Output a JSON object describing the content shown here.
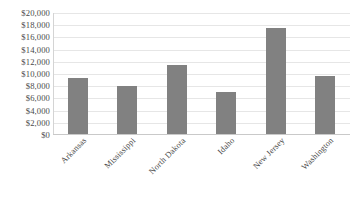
{
  "chart_data": {
    "type": "bar",
    "title": "",
    "subtitle": "",
    "xlabel": "",
    "ylabel": "",
    "categories": [
      "Arkansas",
      "Mississippi",
      "North Dakota",
      "Idaho",
      "New Jersey",
      "Washington"
    ],
    "values": [
      9350,
      8050,
      11500,
      7000,
      17600,
      9600
    ],
    "ylim": [
      0,
      20000
    ],
    "ytick_step": 2000,
    "ytick_labels": [
      "$0",
      "$2,000",
      "$4,000",
      "$6,000",
      "$8,000",
      "$10,000",
      "$12,000",
      "$14,000",
      "$16,000",
      "$18,000",
      "$20,000"
    ],
    "ytick_values": [
      0,
      2000,
      4000,
      6000,
      8000,
      10000,
      12000,
      14000,
      16000,
      18000,
      20000
    ],
    "grid": true,
    "legend": false,
    "legend_position": "none",
    "series": [
      {
        "name": "",
        "values": [
          9350,
          8050,
          11500,
          7000,
          17600,
          9600
        ]
      }
    ],
    "colors": {
      "bar": "#818181",
      "gridline": "#e6e6e6",
      "axis": "#c9c9c9",
      "background": "#ffffff",
      "text": "#4a4a4a"
    }
  }
}
